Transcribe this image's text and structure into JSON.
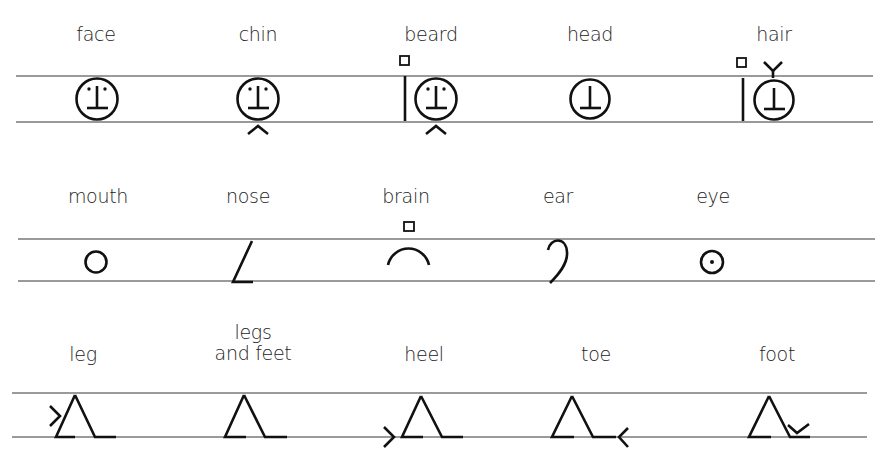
{
  "diagram": {
    "type": "notation-symbol-chart",
    "rows": [
      {
        "id": "row-1",
        "lines": {
          "top_y": 76,
          "bottom_y": 122,
          "x1": 16,
          "x2": 873
        },
        "items": [
          {
            "label": "face",
            "cx": 96,
            "symbol": "face-circle-eyes-nose"
          },
          {
            "label": "chin",
            "cx": 258,
            "symbol": "face-circle-eyes-nose-chin-caret"
          },
          {
            "label": "beard",
            "cx": 431,
            "symbol": "face-bar-square-chin-caret"
          },
          {
            "label": "head",
            "cx": 590,
            "symbol": "circle-nose-only"
          },
          {
            "label": "hair",
            "cx": 774,
            "symbol": "head-bar-square-top-check"
          }
        ]
      },
      {
        "id": "row-2",
        "lines": {
          "top_y": 239,
          "bottom_y": 281,
          "x1": 18,
          "x2": 875
        },
        "items": [
          {
            "label": "mouth",
            "cx": 98,
            "symbol": "small-circle"
          },
          {
            "label": "nose",
            "cx": 248,
            "symbol": "slanted-line-with-foot"
          },
          {
            "label": "brain",
            "cx": 408,
            "symbol": "arch-with-square"
          },
          {
            "label": "ear",
            "cx": 560,
            "symbol": "hook-curve"
          },
          {
            "label": "eye",
            "cx": 712,
            "symbol": "circle-with-dot"
          }
        ]
      },
      {
        "id": "row-3",
        "lines": {
          "top_y": 393,
          "bottom_y": 437,
          "x1": 12,
          "x2": 867
        },
        "items": [
          {
            "label": "leg",
            "cx": 83,
            "symbol": "triangle-leg-left-arrow-mid"
          },
          {
            "label": "legs\nand feet",
            "cx": 250,
            "symbol": "triangle-leg"
          },
          {
            "label": "heel",
            "cx": 424,
            "symbol": "triangle-leg-left-arrow-low"
          },
          {
            "label": "toe",
            "cx": 596,
            "symbol": "triangle-leg-right-arrow-low"
          },
          {
            "label": "foot",
            "cx": 777,
            "symbol": "triangle-leg-check"
          }
        ]
      }
    ]
  },
  "colors": {
    "ink": "#111111",
    "staff_line": "#9a9a9a",
    "background": "#ffffff"
  }
}
